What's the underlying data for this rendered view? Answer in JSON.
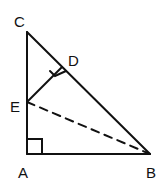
{
  "diagram": {
    "type": "geometry-figure",
    "labels": {
      "A": "A",
      "B": "B",
      "C": "C",
      "D": "D",
      "E": "E"
    },
    "points": {
      "A": [
        27,
        154
      ],
      "B": [
        150,
        154
      ],
      "C": [
        27,
        32
      ],
      "D": [
        62,
        67
      ],
      "E": [
        27,
        102
      ]
    },
    "segments": [
      "CA",
      "AB",
      "CB",
      "ED"
    ],
    "dashed_segments": [
      "EB"
    ],
    "right_angles": [
      "A",
      "D"
    ],
    "stroke_color": "#111111"
  }
}
